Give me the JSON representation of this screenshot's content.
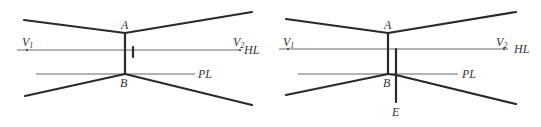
{
  "figure": {
    "panels": [
      {
        "id": "left",
        "labels": {
          "A": "A",
          "B": "B",
          "V1": "V",
          "V1_sub": "1",
          "V2": "V",
          "V2_sub": "2",
          "HL": "HL",
          "PL": "PL"
        },
        "has_tick_mark": true
      },
      {
        "id": "right",
        "labels": {
          "A": "A",
          "B": "B",
          "E": "E",
          "V1": "V",
          "V1_sub": "1",
          "V2": "V",
          "V2_sub": "2",
          "HL": "HL",
          "PL": "PL"
        },
        "has_extension_line_E": true
      }
    ],
    "colors": {
      "line": "#2a2a2a",
      "thin_line": "#555555",
      "text": "#333333"
    }
  }
}
